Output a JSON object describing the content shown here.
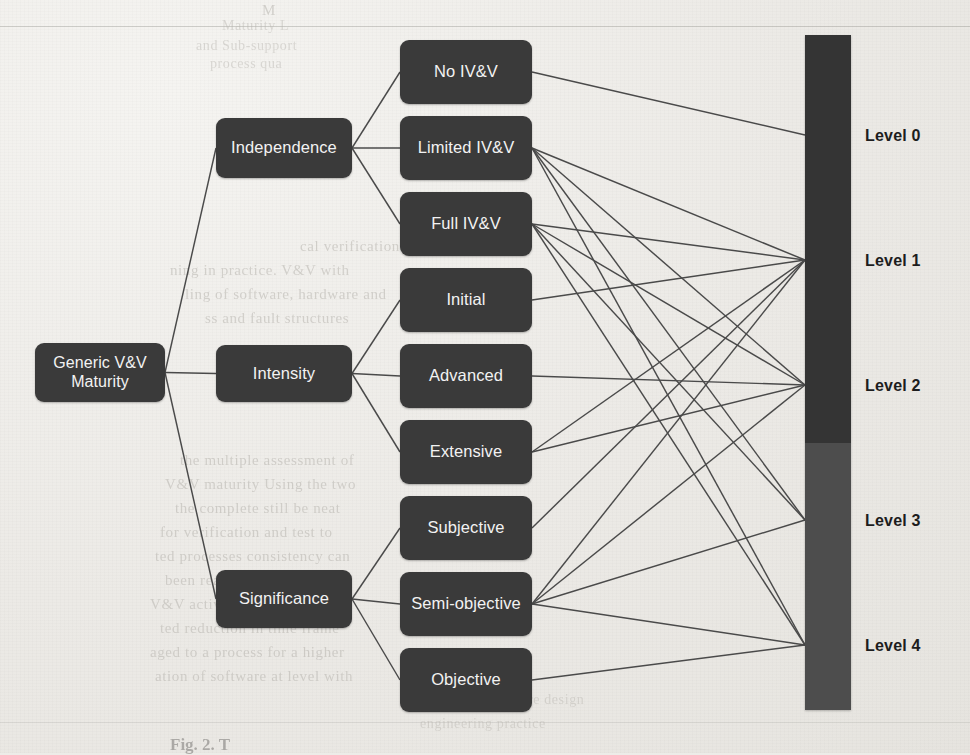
{
  "page": {
    "kind": "scanned-book-page",
    "background_color": "#edece8",
    "node_color": "#3a3a3a",
    "node_text_color": "#f2f2f2",
    "link_color": "#4a4a4a",
    "level_bar_top_color": "#343434",
    "level_bar_bottom_color": "#4d4d4d",
    "caption": "Fig. 2. T"
  },
  "diagram": {
    "title": "Generic V&V Maturity",
    "root": {
      "label": "Generic V&V Maturity",
      "x": 35,
      "y": 343,
      "w": 130,
      "h": 59
    },
    "dimensions": [
      {
        "id": "independence",
        "label": "Independence",
        "x": 216,
        "y": 118,
        "w": 136,
        "h": 60
      },
      {
        "id": "intensity",
        "label": "Intensity",
        "x": 216,
        "y": 345,
        "w": 136,
        "h": 57
      },
      {
        "id": "significance",
        "label": "Significance",
        "x": 216,
        "y": 570,
        "w": 136,
        "h": 58
      }
    ],
    "options": [
      {
        "id": "no-ivv",
        "label": "No IV&V",
        "parent": "independence",
        "x": 400,
        "y": 40,
        "w": 132,
        "h": 64
      },
      {
        "id": "limited-ivv",
        "label": "Limited IV&V",
        "parent": "independence",
        "x": 400,
        "y": 116,
        "w": 132,
        "h": 64
      },
      {
        "id": "full-ivv",
        "label": "Full IV&V",
        "parent": "independence",
        "x": 400,
        "y": 192,
        "w": 132,
        "h": 64
      },
      {
        "id": "initial",
        "label": "Initial",
        "parent": "intensity",
        "x": 400,
        "y": 268,
        "w": 132,
        "h": 64
      },
      {
        "id": "advanced",
        "label": "Advanced",
        "parent": "intensity",
        "x": 400,
        "y": 344,
        "w": 132,
        "h": 64
      },
      {
        "id": "extensive",
        "label": "Extensive",
        "parent": "intensity",
        "x": 400,
        "y": 420,
        "w": 132,
        "h": 64
      },
      {
        "id": "subjective",
        "label": "Subjective",
        "parent": "significance",
        "x": 400,
        "y": 496,
        "w": 132,
        "h": 64
      },
      {
        "id": "semi-objective",
        "label": "Semi-objective",
        "parent": "significance",
        "x": 400,
        "y": 572,
        "w": 132,
        "h": 64
      },
      {
        "id": "objective",
        "label": "Objective",
        "parent": "significance",
        "x": 400,
        "y": 648,
        "w": 132,
        "h": 64
      }
    ],
    "level_bar": {
      "x": 805,
      "y": 35,
      "w": 46,
      "h": 675,
      "split_y": 443,
      "segments": [
        {
          "name": "upper",
          "color": "#343434"
        },
        {
          "name": "lower",
          "color": "#4d4d4d"
        }
      ]
    },
    "levels": [
      {
        "id": "level-0",
        "label": "Level 0",
        "y": 127
      },
      {
        "id": "level-1",
        "label": "Level 1",
        "y": 252
      },
      {
        "id": "level-2",
        "label": "Level 2",
        "y": 377
      },
      {
        "id": "level-3",
        "label": "Level 3",
        "y": 512
      },
      {
        "id": "level-4",
        "label": "Level 4",
        "y": 637
      }
    ],
    "level_links": [
      {
        "from": "no-ivv",
        "to": "level-0"
      },
      {
        "from": "limited-ivv",
        "to": "level-1"
      },
      {
        "from": "limited-ivv",
        "to": "level-2"
      },
      {
        "from": "limited-ivv",
        "to": "level-3"
      },
      {
        "from": "limited-ivv",
        "to": "level-4"
      },
      {
        "from": "full-ivv",
        "to": "level-1"
      },
      {
        "from": "full-ivv",
        "to": "level-2"
      },
      {
        "from": "full-ivv",
        "to": "level-3"
      },
      {
        "from": "full-ivv",
        "to": "level-4"
      },
      {
        "from": "initial",
        "to": "level-1"
      },
      {
        "from": "advanced",
        "to": "level-2"
      },
      {
        "from": "extensive",
        "to": "level-1"
      },
      {
        "from": "extensive",
        "to": "level-2"
      },
      {
        "from": "subjective",
        "to": "level-1"
      },
      {
        "from": "semi-objective",
        "to": "level-1"
      },
      {
        "from": "semi-objective",
        "to": "level-2"
      },
      {
        "from": "semi-objective",
        "to": "level-3"
      },
      {
        "from": "semi-objective",
        "to": "level-4"
      },
      {
        "from": "objective",
        "to": "level-4"
      }
    ]
  },
  "bleed_text": [
    {
      "text": "M",
      "x": 262,
      "y": 2,
      "size": 15
    },
    {
      "text": "Maturity L",
      "x": 222,
      "y": 18,
      "size": 14
    },
    {
      "text": "and      Sub-support",
      "x": 196,
      "y": 38,
      "size": 14
    },
    {
      "text": "process  qua",
      "x": 210,
      "y": 56,
      "size": 14
    },
    {
      "text": "cal verification and design",
      "x": 300,
      "y": 238,
      "size": 15
    },
    {
      "text": "ning  in  practice.  V&V  with",
      "x": 170,
      "y": 262,
      "size": 15
    },
    {
      "text": "ling of software, hardware and",
      "x": 185,
      "y": 286,
      "size": 15
    },
    {
      "text": "ss  and  fault  structures",
      "x": 205,
      "y": 310,
      "size": 15
    },
    {
      "text": "the  multiple  assessment  of",
      "x": 180,
      "y": 452,
      "size": 15
    },
    {
      "text": "V&V  maturity  Using  the  two",
      "x": 165,
      "y": 476,
      "size": 15
    },
    {
      "text": "the  complete  still  be  neat",
      "x": 175,
      "y": 500,
      "size": 15
    },
    {
      "text": "for  verification  and  test  to",
      "x": 160,
      "y": 524,
      "size": 15
    },
    {
      "text": "ted  processes  consistency  can",
      "x": 155,
      "y": 548,
      "size": 15
    },
    {
      "text": "been  reached  a  high  degree",
      "x": 165,
      "y": 572,
      "size": 15
    },
    {
      "text": "V&V  activities  are  well  and",
      "x": 150,
      "y": 596,
      "size": 15
    },
    {
      "text": "ted  reduction  in  time  frame",
      "x": 160,
      "y": 620,
      "size": 15
    },
    {
      "text": "aged  to  a  process  for  a  higher",
      "x": 150,
      "y": 644,
      "size": 15
    },
    {
      "text": "ation  of  software  at  level  with",
      "x": 155,
      "y": 668,
      "size": 15
    },
    {
      "text": "hardware  and  software  design",
      "x": 400,
      "y": 692,
      "size": 14
    },
    {
      "text": "engineering  practice",
      "x": 420,
      "y": 716,
      "size": 14
    }
  ]
}
